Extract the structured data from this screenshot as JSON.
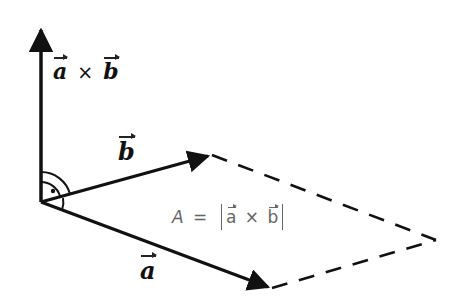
{
  "diagram": {
    "labels": {
      "cross_product": {
        "a": "a",
        "op": "×",
        "b": "b"
      },
      "vector_b": "b",
      "vector_a": "a",
      "area_formula": {
        "lhs": "A",
        "eq": "=",
        "a": "a",
        "op": "×",
        "b": "b"
      }
    },
    "geometry": {
      "origin": [
        41,
        202
      ],
      "cross_tip": [
        41,
        25
      ],
      "b_tip": [
        210,
        155
      ],
      "a_tip": [
        270,
        288
      ],
      "far_vertex": [
        436,
        240
      ]
    },
    "markers": {
      "right_angle": "dot-in-double-arc"
    },
    "colors": {
      "stroke": "#111111",
      "formula_text": "#666666",
      "background": "#ffffff"
    }
  }
}
